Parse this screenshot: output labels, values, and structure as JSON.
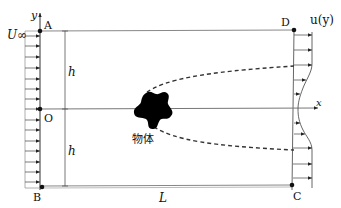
{
  "labels": {
    "y_axis": "y",
    "x_axis": "x",
    "point_a": "A",
    "point_b": "B",
    "point_c": "C",
    "point_d": "D",
    "origin": "O",
    "freestream": "U∞",
    "outflow": "u(y)",
    "height_upper": "h",
    "height_lower": "h",
    "length": "L",
    "body": "物体"
  },
  "colors": {
    "line": "#222222",
    "frame": "#777777",
    "body": "#000000",
    "background": "#ffffff"
  },
  "inflow_arrow_count": 15,
  "outflow_arrow_count": 11
}
